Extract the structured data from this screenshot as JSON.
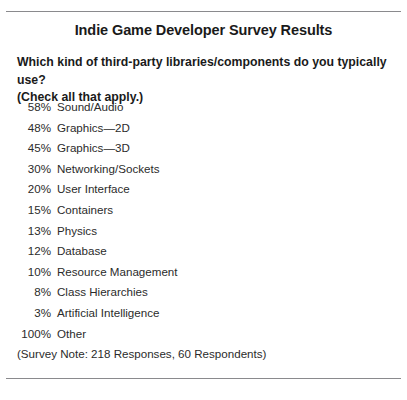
{
  "document": {
    "title": "Indie Game Developer Survey Results",
    "question": {
      "line1": "Which kind of third-party libraries/components do you typically use?",
      "line2": "(Check all that apply.)"
    },
    "footnote": "(Survey Note: 218 Responses, 60 Respondents)",
    "rule_color": "#8a8a8d",
    "text_color": "#231f20",
    "background_color": "#ffffff"
  },
  "chart_data": {
    "type": "table",
    "title": "Indie Game Developer Survey Results",
    "subtitle": "Which kind of third-party libraries/components do you typically use? (Check all that apply.)",
    "xlabel": "",
    "ylabel": "Percent of respondents",
    "categories": [
      "Sound/Audio",
      "Graphics—2D",
      "Graphics—3D",
      "Networking/Sockets",
      "User Interface",
      "Containers",
      "Physics",
      "Database",
      "Resource Management",
      "Class Hierarchies",
      "Artificial Intelligence",
      "Other"
    ],
    "values": [
      58,
      48,
      45,
      30,
      20,
      15,
      13,
      12,
      10,
      8,
      3,
      100
    ],
    "value_labels": [
      "58%",
      "48%",
      "45%",
      "30%",
      "20%",
      "15%",
      "13%",
      "12%",
      "10%",
      "8%",
      "3%",
      "100%"
    ],
    "annotations": [
      "(Survey Note: 218 Responses, 60 Respondents)"
    ],
    "legend": [],
    "grid": false
  },
  "rows": [
    {
      "pct": "58%",
      "label": "Sound/Audio"
    },
    {
      "pct": "48%",
      "label": "Graphics—2D"
    },
    {
      "pct": "45%",
      "label": "Graphics—3D"
    },
    {
      "pct": "30%",
      "label": "Networking/Sockets"
    },
    {
      "pct": "20%",
      "label": "User Interface"
    },
    {
      "pct": "15%",
      "label": "Containers"
    },
    {
      "pct": "13%",
      "label": "Physics"
    },
    {
      "pct": "12%",
      "label": "Database"
    },
    {
      "pct": "10%",
      "label": "Resource Management"
    },
    {
      "pct": "8%",
      "label": "Class Hierarchies"
    },
    {
      "pct": "3%",
      "label": "Artificial Intelligence"
    },
    {
      "pct": "100%",
      "label": "Other"
    }
  ]
}
